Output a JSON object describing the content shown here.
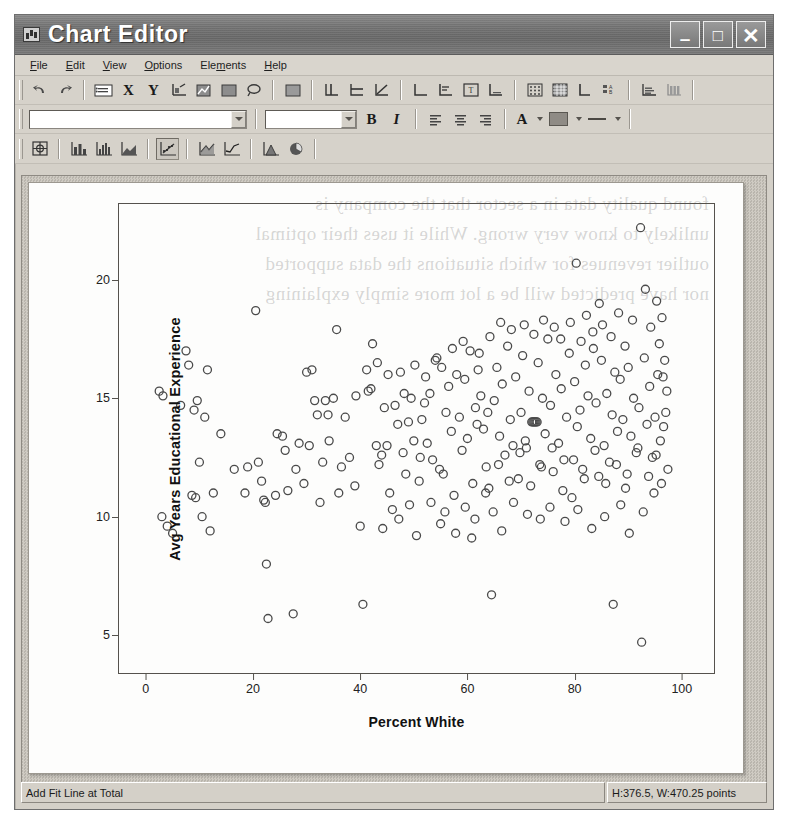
{
  "window": {
    "title": "Chart Editor",
    "icon": "chart-window-icon",
    "controls": {
      "minimize": "–",
      "maximize": "□",
      "close": "✕"
    }
  },
  "menubar": {
    "items": [
      {
        "label": "File",
        "accel": "F"
      },
      {
        "label": "Edit",
        "accel": "E"
      },
      {
        "label": "View",
        "accel": "V"
      },
      {
        "label": "Options",
        "accel": "O"
      },
      {
        "label": "Elements",
        "accel": "m"
      },
      {
        "label": "Help",
        "accel": "H"
      }
    ]
  },
  "toolbars": {
    "edit": {
      "buttons": [
        {
          "name": "undo-icon",
          "label": "Undo"
        },
        {
          "name": "redo-icon",
          "label": "Redo"
        },
        {
          "name": "properties-icon",
          "label": "Properties"
        },
        {
          "name": "x-axis-icon",
          "label": "X"
        },
        {
          "name": "y-axis-icon",
          "label": "Y"
        },
        {
          "name": "transpose-icon",
          "label": "Transpose Chart"
        },
        {
          "name": "chart-type-icon",
          "label": "Chart Type"
        },
        {
          "name": "fill-region-icon",
          "label": "Fill Region"
        },
        {
          "name": "lasso-select-icon",
          "label": "Lasso Select"
        },
        {
          "name": "pattern-icon",
          "label": "Pattern"
        },
        {
          "name": "add-reference-line-icon",
          "label": "Add Reference Line"
        },
        {
          "name": "add-fit-line-icon",
          "label": "Add Fit Line at Total"
        },
        {
          "name": "add-interpolation-icon",
          "label": "Add Interpolation Line"
        },
        {
          "name": "show-x-axis-icon",
          "label": "Show X Axis"
        },
        {
          "name": "show-y-axis-icon",
          "label": "Show Y Axis"
        },
        {
          "name": "title-icon",
          "label": "Add Title"
        },
        {
          "name": "footnote-icon",
          "label": "Add Footnote"
        },
        {
          "name": "scatter-matrix-icon",
          "label": "Scatterplot Matrix"
        },
        {
          "name": "grid-lines-icon",
          "label": "Show Grid Lines"
        },
        {
          "name": "axis-label-icon",
          "label": "Axis Labels"
        },
        {
          "name": "legend-icon",
          "label": "Show Legend"
        },
        {
          "name": "data-label-icon",
          "label": "Show Data Labels"
        },
        {
          "name": "bin-icon",
          "label": "Bin Element"
        }
      ]
    },
    "format": {
      "font_name": {
        "value": "",
        "placeholder": ""
      },
      "font_size": {
        "value": "",
        "placeholder": ""
      },
      "bold_label": "B",
      "italic_label": "I",
      "buttons": [
        {
          "name": "align-left-icon",
          "label": "Align Left"
        },
        {
          "name": "align-center-icon",
          "label": "Align Center"
        },
        {
          "name": "align-right-icon",
          "label": "Align Right"
        },
        {
          "name": "text-color-icon",
          "label": "Text Color"
        },
        {
          "name": "fill-color-icon",
          "label": "Fill Color"
        },
        {
          "name": "line-style-icon",
          "label": "Line Style"
        }
      ],
      "text_color_glyph": "A",
      "fill_color": "#8f8b85"
    },
    "charts": {
      "buttons": [
        {
          "name": "grid-layout-icon",
          "label": "Grid Layout"
        },
        {
          "name": "bar-chart-icon",
          "label": "Bar Chart"
        },
        {
          "name": "histogram-icon",
          "label": "Histogram"
        },
        {
          "name": "area-chart-icon",
          "label": "Area Chart"
        },
        {
          "name": "scatter-plot-icon",
          "label": "Scatter Plot",
          "pressed": true
        },
        {
          "name": "line-area-icon",
          "label": "Line / Area"
        },
        {
          "name": "line-chart-icon",
          "label": "Line Chart"
        },
        {
          "name": "filled-area-icon",
          "label": "Filled Area"
        },
        {
          "name": "pie-chart-icon",
          "label": "Pie Chart"
        }
      ]
    }
  },
  "statusbar": {
    "message": "Add Fit Line at Total",
    "dimensions": "H:376.5, W:470.25 points"
  },
  "ghost_text": "found quality data in a sector that the company is\nunlikely to know very wrong. While it uses their optimal\noutlier revenues for which situations the data supported\nnor have predicted will be a lot more simply explaining",
  "chart_data": {
    "type": "scatter",
    "title": "",
    "xlabel": "Percent White",
    "ylabel": "Avg Years Educational Experience",
    "xlim": [
      -5,
      106
    ],
    "ylim": [
      3.4,
      23.2
    ],
    "xticks": [
      0,
      20,
      40,
      60,
      80,
      100
    ],
    "yticks": [
      5,
      10,
      15,
      20
    ],
    "grid": false,
    "legend": null,
    "marker": {
      "shape": "open-circle",
      "stroke": "#4a4a4a",
      "fill": "none",
      "size": 8
    },
    "points": [
      [
        2.5,
        15.3
      ],
      [
        3.2,
        15.1
      ],
      [
        3.0,
        10.0
      ],
      [
        4.0,
        9.6
      ],
      [
        5.0,
        9.3
      ],
      [
        6.5,
        14.7
      ],
      [
        7.5,
        17.0
      ],
      [
        8.0,
        16.4
      ],
      [
        9.0,
        14.5
      ],
      [
        9.6,
        14.9
      ],
      [
        8.6,
        10.9
      ],
      [
        9.3,
        10.8
      ],
      [
        10.0,
        12.3
      ],
      [
        10.5,
        10.0
      ],
      [
        11.5,
        16.2
      ],
      [
        11.0,
        14.2
      ],
      [
        12.6,
        11.0
      ],
      [
        12.0,
        9.4
      ],
      [
        14.0,
        13.5
      ],
      [
        16.5,
        12.0
      ],
      [
        18.5,
        11.0
      ],
      [
        19.0,
        12.1
      ],
      [
        20.5,
        18.7
      ],
      [
        21.0,
        12.3
      ],
      [
        21.6,
        11.5
      ],
      [
        22.0,
        10.7
      ],
      [
        22.3,
        10.6
      ],
      [
        22.5,
        8.0
      ],
      [
        22.8,
        5.7
      ],
      [
        24.5,
        13.5
      ],
      [
        25.5,
        13.4
      ],
      [
        26.0,
        12.8
      ],
      [
        27.5,
        5.9
      ],
      [
        28.0,
        12.0
      ],
      [
        29.5,
        11.4
      ],
      [
        30.0,
        16.1
      ],
      [
        31.0,
        16.2
      ],
      [
        31.5,
        14.9
      ],
      [
        32.0,
        14.3
      ],
      [
        32.5,
        10.6
      ],
      [
        33.0,
        12.3
      ],
      [
        33.5,
        14.9
      ],
      [
        34.0,
        14.3
      ],
      [
        35.0,
        15.0
      ],
      [
        35.6,
        17.9
      ],
      [
        36.0,
        11.0
      ],
      [
        36.5,
        12.1
      ],
      [
        38.0,
        12.5
      ],
      [
        39.0,
        11.3
      ],
      [
        40.0,
        9.6
      ],
      [
        40.5,
        6.3
      ],
      [
        41.5,
        15.3
      ],
      [
        42.0,
        15.4
      ],
      [
        42.3,
        17.3
      ],
      [
        43.0,
        13.0
      ],
      [
        43.5,
        12.2
      ],
      [
        44.0,
        12.6
      ],
      [
        44.5,
        14.6
      ],
      [
        45.0,
        13.0
      ],
      [
        45.5,
        11.0
      ],
      [
        46.0,
        10.3
      ],
      [
        46.5,
        14.7
      ],
      [
        47.0,
        13.9
      ],
      [
        47.5,
        16.1
      ],
      [
        48.0,
        12.7
      ],
      [
        48.5,
        11.8
      ],
      [
        49.0,
        14.0
      ],
      [
        49.5,
        15.0
      ],
      [
        50.0,
        13.2
      ],
      [
        50.5,
        9.2
      ],
      [
        51.0,
        11.5
      ],
      [
        51.5,
        14.1
      ],
      [
        52.0,
        14.8
      ],
      [
        52.5,
        13.1
      ],
      [
        53.0,
        15.2
      ],
      [
        53.5,
        12.4
      ],
      [
        54.0,
        16.6
      ],
      [
        54.3,
        16.7
      ],
      [
        54.8,
        12.0
      ],
      [
        55.0,
        9.7
      ],
      [
        55.5,
        11.8
      ],
      [
        56.0,
        14.4
      ],
      [
        56.5,
        15.5
      ],
      [
        57.0,
        13.6
      ],
      [
        57.5,
        10.9
      ],
      [
        58.0,
        16.0
      ],
      [
        58.5,
        14.2
      ],
      [
        59.0,
        12.8
      ],
      [
        59.5,
        15.8
      ],
      [
        60.0,
        13.3
      ],
      [
        60.5,
        17.0
      ],
      [
        60.8,
        9.1
      ],
      [
        61.0,
        11.4
      ],
      [
        61.5,
        14.6
      ],
      [
        62.0,
        16.2
      ],
      [
        62.5,
        15.1
      ],
      [
        63.0,
        13.7
      ],
      [
        63.5,
        12.1
      ],
      [
        64.0,
        11.2
      ],
      [
        64.5,
        6.7
      ],
      [
        65.0,
        14.9
      ],
      [
        65.5,
        16.3
      ],
      [
        66.0,
        13.4
      ],
      [
        66.5,
        15.6
      ],
      [
        67.0,
        12.6
      ],
      [
        67.5,
        17.2
      ],
      [
        68.0,
        14.1
      ],
      [
        68.5,
        13.0
      ],
      [
        69.0,
        15.9
      ],
      [
        69.5,
        11.6
      ],
      [
        70.0,
        14.4
      ],
      [
        70.3,
        16.8
      ],
      [
        70.8,
        13.2
      ],
      [
        71.0,
        12.9
      ],
      [
        71.5,
        15.3
      ],
      [
        72.0,
        14.0
      ],
      [
        72.2,
        14.0
      ],
      [
        72.4,
        14.0
      ],
      [
        72.6,
        14.0
      ],
      [
        72.8,
        14.0
      ],
      [
        73.0,
        14.0
      ],
      [
        73.2,
        16.5
      ],
      [
        73.5,
        12.2
      ],
      [
        74.0,
        15.0
      ],
      [
        74.5,
        13.5
      ],
      [
        75.0,
        17.5
      ],
      [
        75.5,
        14.7
      ],
      [
        76.0,
        11.9
      ],
      [
        76.5,
        16.0
      ],
      [
        77.0,
        13.1
      ],
      [
        77.5,
        15.4
      ],
      [
        78.0,
        12.4
      ],
      [
        78.5,
        14.2
      ],
      [
        79.0,
        16.9
      ],
      [
        79.5,
        10.8
      ],
      [
        80.0,
        15.7
      ],
      [
        80.3,
        20.7
      ],
      [
        80.5,
        13.8
      ],
      [
        81.0,
        14.5
      ],
      [
        81.5,
        12.0
      ],
      [
        82.0,
        16.4
      ],
      [
        82.5,
        15.1
      ],
      [
        83.0,
        13.3
      ],
      [
        83.5,
        17.1
      ],
      [
        84.0,
        14.8
      ],
      [
        84.5,
        11.7
      ],
      [
        85.0,
        16.6
      ],
      [
        85.5,
        13.0
      ],
      [
        86.0,
        15.2
      ],
      [
        86.5,
        12.3
      ],
      [
        87.0,
        14.3
      ],
      [
        87.2,
        6.3
      ],
      [
        87.5,
        16.1
      ],
      [
        88.0,
        13.6
      ],
      [
        88.5,
        15.8
      ],
      [
        89.0,
        14.1
      ],
      [
        89.5,
        11.2
      ],
      [
        90.0,
        16.3
      ],
      [
        90.5,
        13.4
      ],
      [
        91.0,
        15.0
      ],
      [
        91.5,
        12.7
      ],
      [
        92.0,
        14.6
      ],
      [
        92.3,
        22.2
      ],
      [
        92.5,
        4.7
      ],
      [
        93.0,
        16.7
      ],
      [
        93.5,
        13.9
      ],
      [
        94.0,
        15.5
      ],
      [
        94.5,
        12.5
      ],
      [
        95.0,
        14.2
      ],
      [
        95.3,
        19.1
      ],
      [
        95.5,
        16.0
      ],
      [
        96.0,
        13.2
      ],
      [
        96.3,
        18.4
      ],
      [
        96.5,
        15.9
      ],
      [
        97.0,
        14.4
      ],
      [
        93.2,
        19.6
      ],
      [
        94.2,
        18.0
      ],
      [
        95.8,
        17.3
      ],
      [
        96.8,
        16.6
      ],
      [
        97.2,
        15.3
      ],
      [
        85.2,
        18.1
      ],
      [
        86.8,
        17.6
      ],
      [
        88.2,
        18.6
      ],
      [
        89.4,
        17.2
      ],
      [
        90.8,
        18.3
      ],
      [
        82.2,
        18.5
      ],
      [
        83.4,
        17.8
      ],
      [
        84.6,
        19.0
      ],
      [
        81.2,
        17.4
      ],
      [
        79.2,
        18.2
      ],
      [
        76.2,
        18.0
      ],
      [
        77.4,
        17.5
      ],
      [
        74.2,
        18.3
      ],
      [
        72.4,
        17.7
      ],
      [
        70.6,
        18.1
      ],
      [
        68.2,
        17.9
      ],
      [
        66.2,
        18.2
      ],
      [
        64.2,
        17.6
      ],
      [
        62.2,
        16.9
      ],
      [
        59.2,
        17.4
      ],
      [
        57.2,
        17.1
      ],
      [
        55.2,
        16.3
      ],
      [
        52.2,
        15.9
      ],
      [
        50.2,
        16.4
      ],
      [
        48.2,
        15.2
      ],
      [
        45.2,
        16.0
      ],
      [
        43.2,
        16.5
      ],
      [
        41.2,
        16.2
      ],
      [
        39.2,
        15.1
      ],
      [
        37.2,
        14.2
      ],
      [
        34.2,
        13.2
      ],
      [
        30.5,
        13.0
      ],
      [
        28.6,
        13.1
      ],
      [
        26.5,
        11.1
      ],
      [
        24.2,
        10.9
      ],
      [
        64.8,
        10.2
      ],
      [
        66.4,
        9.4
      ],
      [
        68.6,
        10.6
      ],
      [
        71.2,
        10.1
      ],
      [
        73.6,
        9.9
      ],
      [
        75.4,
        10.4
      ],
      [
        78.2,
        9.8
      ],
      [
        80.6,
        10.3
      ],
      [
        83.2,
        9.5
      ],
      [
        85.6,
        10.0
      ],
      [
        88.6,
        10.5
      ],
      [
        90.2,
        9.3
      ],
      [
        92.8,
        10.2
      ],
      [
        94.8,
        11.0
      ],
      [
        96.2,
        11.4
      ],
      [
        59.6,
        10.4
      ],
      [
        61.4,
        9.9
      ],
      [
        63.4,
        11.0
      ],
      [
        57.8,
        9.3
      ],
      [
        55.8,
        10.2
      ],
      [
        53.2,
        10.6
      ],
      [
        51.2,
        12.5
      ],
      [
        49.2,
        10.5
      ],
      [
        47.2,
        9.9
      ],
      [
        44.2,
        9.5
      ],
      [
        61.8,
        13.9
      ],
      [
        63.8,
        14.4
      ],
      [
        65.8,
        12.2
      ],
      [
        67.8,
        11.5
      ],
      [
        69.8,
        12.7
      ],
      [
        71.8,
        11.3
      ],
      [
        73.8,
        12.1
      ],
      [
        75.8,
        12.9
      ],
      [
        77.8,
        11.1
      ],
      [
        79.8,
        12.4
      ],
      [
        81.8,
        11.6
      ],
      [
        83.8,
        12.8
      ],
      [
        85.8,
        11.4
      ],
      [
        87.8,
        12.2
      ],
      [
        89.8,
        11.8
      ],
      [
        91.8,
        12.9
      ],
      [
        93.8,
        11.7
      ],
      [
        95.2,
        12.6
      ],
      [
        96.6,
        13.8
      ],
      [
        97.4,
        12.0
      ]
    ]
  }
}
